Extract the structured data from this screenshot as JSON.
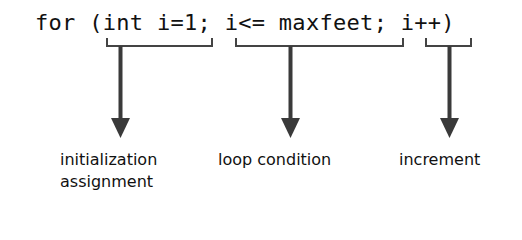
{
  "code": {
    "line": "for (int i=1; i<= maxfeet; i++)"
  },
  "annotations": [
    {
      "id": "init",
      "segment": "int i=1",
      "label_line1": "initialization",
      "label_line2": "assignment"
    },
    {
      "id": "cond",
      "segment": "i<= maxfeet",
      "label_line1": "loop condition"
    },
    {
      "id": "incr",
      "segment": "i++",
      "label_line1": "increment"
    }
  ],
  "colors": {
    "text": "#111111",
    "arrow": "#3a3a3a",
    "bracket": "#444444",
    "background": "#ffffff"
  }
}
